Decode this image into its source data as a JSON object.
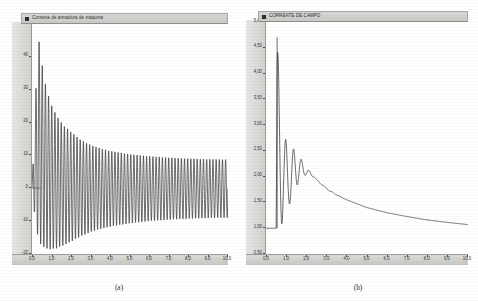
{
  "figures": [
    {
      "caption": "(a)",
      "legend_label": "Corrente de armadura de máquina",
      "legend_marker": "square-marker"
    },
    {
      "caption": "(b)",
      "legend_label": "CORRENTE DE CAMPO",
      "legend_marker": "square-marker"
    }
  ],
  "chart_data": [
    {
      "type": "line",
      "title": "Corrente de armadura de máquina",
      "xlabel": "",
      "ylabel": "",
      "xlim": [
        0.0,
        10.0
      ],
      "ylim": [
        -20,
        50
      ],
      "xticks": [
        "0,0",
        "1,0",
        "2,0",
        "3,0",
        "4,0",
        "5,0",
        "6,0",
        "7,0",
        "8,0",
        "9,0",
        "10,0"
      ],
      "yticks": [
        "50",
        "40",
        "30",
        "20",
        "10",
        "0",
        "-10",
        "-20"
      ],
      "grid": false,
      "legend": "top",
      "series": [
        {
          "name": "Corrente de armadura de máquina",
          "description": "Damped symmetric oscillation about zero; envelope peaks near t=0.35 s and decays toward a steady band",
          "envelope_upper": {
            "x": [
              0.0,
              0.2,
              0.35,
              0.5,
              0.7,
              1.0,
              1.3,
              1.6,
              2.0,
              2.5,
              3.0,
              3.5,
              4.0,
              5.0,
              6.0,
              7.0,
              8.0,
              9.0,
              10.0
            ],
            "y": [
              0,
              30,
              45,
              38,
              31,
              25,
              21.5,
              19,
              17,
              14.5,
              13,
              12,
              11.2,
              10.2,
              9.6,
              9.2,
              8.9,
              8.7,
              8.6
            ]
          },
          "envelope_lower": {
            "x": [
              0.0,
              0.2,
              0.35,
              0.5,
              0.7,
              1.0,
              1.3,
              1.6,
              2.0,
              2.5,
              3.0,
              3.5,
              4.0,
              5.0,
              6.0,
              7.0,
              8.0,
              9.0,
              10.0
            ],
            "y": [
              0,
              -12,
              -16,
              -17.5,
              -18.3,
              -18.6,
              -18.2,
              -17.4,
              -16.2,
              -14.6,
              -13.3,
              -12.4,
              -11.7,
              -10.7,
              -10.0,
              -9.6,
              -9.3,
              -9.1,
              -9.0
            ]
          },
          "oscillation_cycles": 62,
          "color": "#3d3d3d"
        }
      ]
    },
    {
      "type": "line",
      "title": "CORRENTE DE CAMPO",
      "xlabel": "",
      "ylabel": "",
      "xlim": [
        0.0,
        10.0
      ],
      "ylim": [
        0.5,
        5.0
      ],
      "xticks": [
        "0,0",
        "1,0",
        "2,0",
        "3,0",
        "4,0",
        "5,0",
        "6,0",
        "7,0",
        "8,0",
        "9,0",
        "10,0"
      ],
      "yticks": [
        "5,00",
        "4,50",
        "4,00",
        "3,50",
        "3,00",
        "2,50",
        "2,00",
        "1,50",
        "1,00",
        "0,50"
      ],
      "grid": false,
      "legend": "top",
      "series": [
        {
          "name": "CORRENTE DE CAMPO",
          "description": "Starts at steady 1.0 p.u., jumps to a 4.70 peak with heavy oscillation, then decays back toward 1.0 p.u.",
          "initial_value": 1.0,
          "peak_value": 4.7,
          "peak_time": 0.55,
          "final_value": 1.0,
          "mean_curve": {
            "x": [
              0.0,
              0.5,
              0.55,
              0.7,
              0.9,
              1.1,
              1.3,
              1.5,
              1.8,
              2.0,
              2.5,
              3.0,
              3.5,
              4.0,
              5.0,
              6.0,
              7.0,
              8.0,
              9.0,
              10.0
            ],
            "y": [
              1.0,
              1.0,
              4.7,
              3.55,
              2.85,
              2.52,
              2.55,
              2.5,
              2.3,
              2.18,
              1.95,
              1.78,
              1.65,
              1.55,
              1.4,
              1.3,
              1.22,
              1.16,
              1.11,
              1.07
            ]
          },
          "envelope_lower": {
            "x": [
              0.5,
              0.6,
              0.75,
              0.9,
              1.05,
              1.2,
              1.35,
              1.5,
              1.7,
              1.9,
              2.1,
              2.4,
              2.8,
              3.2,
              4.0,
              5.0,
              6.0,
              8.0,
              10.0
            ],
            "y": [
              1.0,
              0.95,
              1.05,
              1.2,
              1.35,
              1.5,
              1.65,
              1.8,
              1.95,
              2.02,
              2.05,
              1.98,
              1.82,
              1.7,
              1.55,
              1.4,
              1.3,
              1.16,
              1.07
            ]
          },
          "oscillation_cycles": 26,
          "color": "#2a2a2a"
        }
      ]
    }
  ]
}
